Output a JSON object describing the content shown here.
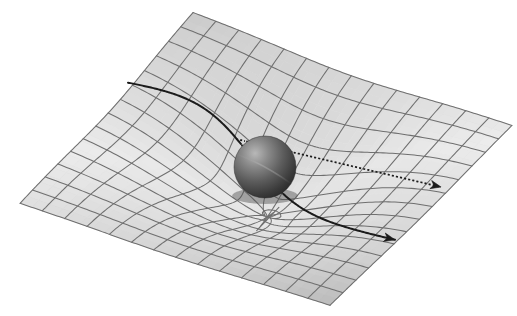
{
  "figure": {
    "background_color": "#ffffff",
    "width": 517,
    "height": 316
  },
  "chart_data": {
    "type": "diagram",
    "xlabel": "",
    "ylabel": "",
    "projection": {
      "corner_left": [
        20,
        203
      ],
      "corner_top": [
        193,
        12
      ],
      "corner_right": [
        512,
        125
      ],
      "corner_bottom": [
        330,
        305
      ],
      "grid_divisions_u": 14,
      "grid_divisions_v": 14
    },
    "well": {
      "center_u": 0.52,
      "center_v": 0.5,
      "depth_px": 62,
      "radius": 0.3,
      "lateral_pinch": 0.42
    },
    "sphere": {
      "center": [
        265,
        167
      ],
      "radius": 31,
      "base_color": "#4a4a4a",
      "highlight_color": "#bdbdbd",
      "shadow_color": "#1e1e1e",
      "seam_color": "#8c8c8c"
    },
    "surface_shading": {
      "bright_color": "#f2f2f2",
      "mid_color": "#d2d2d2",
      "dark_color": "#9a9a9a",
      "grid_line_color": "#6f6f6f"
    },
    "rays": [
      {
        "name": "deflected-light-ray",
        "style": "solid",
        "color": "#1b1b1b",
        "entry_point": [
          128,
          82
        ],
        "exit_point": [
          395,
          238
        ],
        "arrow_at": "exit",
        "label": "deflected path"
      },
      {
        "name": "undeflected-light-ray",
        "style": "dotted",
        "color": "#1b1b1b",
        "entry_point": [
          236,
          139
        ],
        "exit_point": [
          441,
          187
        ],
        "arrow_at": "exit",
        "label": "straight (undeflected) path"
      }
    ]
  },
  "labels": {
    "caption": ""
  }
}
